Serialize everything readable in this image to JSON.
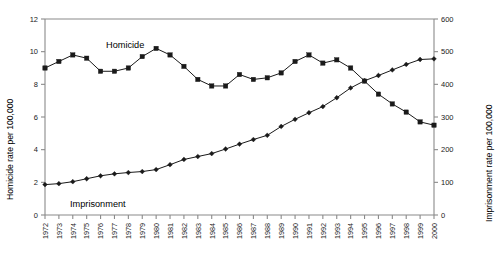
{
  "chart_data": {
    "type": "line",
    "title": "",
    "xlabel": "",
    "ylabel": "Homicide rate per 100,000",
    "y2label": "Imprisonment rate per 100,000",
    "ylim": [
      0,
      12
    ],
    "y2lim": [
      0,
      600
    ],
    "grid": false,
    "legend_position": "inline-annotation",
    "yticks": [
      "0",
      "2",
      "4",
      "6",
      "8",
      "10",
      "12"
    ],
    "y2ticks": [
      "0",
      "100",
      "200",
      "300",
      "400",
      "500",
      "600"
    ],
    "categories": [
      "1972",
      "1973",
      "1974",
      "1975",
      "1976",
      "1977",
      "1978",
      "1979",
      "1980",
      "1981",
      "1982",
      "1983",
      "1984",
      "1985",
      "1986",
      "1987",
      "1988",
      "1989",
      "1990",
      "1991",
      "1992",
      "1993",
      "1994",
      "1995",
      "1996",
      "1997",
      "1998",
      "1999",
      "2000"
    ],
    "series": [
      {
        "name": "Homicide",
        "axis": "left",
        "marker": "square",
        "values": [
          9.0,
          9.4,
          9.8,
          9.6,
          8.8,
          8.8,
          9.0,
          9.7,
          10.2,
          9.8,
          9.1,
          8.3,
          7.9,
          7.9,
          8.6,
          8.3,
          8.4,
          8.7,
          9.4,
          9.8,
          9.3,
          9.5,
          9.0,
          8.2,
          7.4,
          6.8,
          6.3,
          5.7,
          5.5
        ]
      },
      {
        "name": "Imprisonment",
        "axis": "right",
        "marker": "diamond",
        "values": [
          93,
          96,
          102,
          111,
          120,
          126,
          130,
          133,
          139,
          154,
          170,
          179,
          188,
          202,
          217,
          231,
          244,
          271,
          293,
          313,
          332,
          359,
          389,
          411,
          427,
          444,
          461,
          476,
          478
        ]
      }
    ],
    "annotations": [
      {
        "text": "Homicide",
        "series": "Homicide"
      },
      {
        "text": "Imprisonment",
        "series": "Imprisonment"
      }
    ]
  },
  "colors": {
    "series_line": "#1a1a1a",
    "axis": "#8a8a8a",
    "text": "#000000",
    "background": "#ffffff"
  }
}
